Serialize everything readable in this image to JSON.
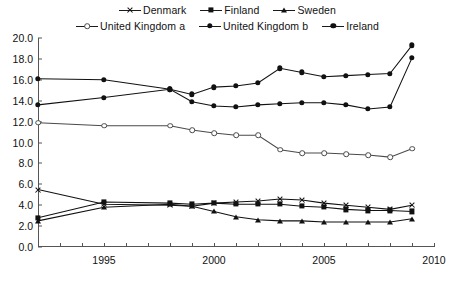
{
  "legend": {
    "rows": [
      [
        {
          "label": "Denmark",
          "marker": "cross"
        },
        {
          "label": "Finland",
          "marker": "square"
        },
        {
          "label": "Sweden",
          "marker": "triangle"
        }
      ],
      [
        {
          "label": "United Kingdom a",
          "marker": "opencircle"
        },
        {
          "label": "United Kingdom b",
          "marker": "circle"
        },
        {
          "label": "Ireland",
          "marker": "circle"
        }
      ]
    ]
  },
  "chart_data": {
    "type": "line",
    "title": "",
    "xlabel": "",
    "ylabel": "",
    "xlim": [
      1992,
      2010
    ],
    "ylim": [
      0.0,
      20.0
    ],
    "yticks": [
      "0.0",
      "2.0",
      "4.0",
      "6.0",
      "8.0",
      "10.0",
      "12.0",
      "14.0",
      "16.0",
      "18.0",
      "20.0"
    ],
    "ytick_values": [
      0,
      2,
      4,
      6,
      8,
      10,
      12,
      14,
      16,
      18,
      20
    ],
    "xticks": [
      "1995",
      "2000",
      "2005",
      "2010"
    ],
    "xtick_values": [
      1995,
      2000,
      2005,
      2010
    ],
    "xtick_minor": [
      1992,
      1993,
      1994,
      1996,
      1997,
      1998,
      1999,
      2001,
      2002,
      2003,
      2004,
      2006,
      2007,
      2008,
      2009
    ],
    "grid": false,
    "legend_position": "top",
    "x": [
      1992,
      1995,
      1998,
      1999,
      2000,
      2001,
      2002,
      2003,
      2004,
      2005,
      2006,
      2007,
      2008,
      2009
    ],
    "series": [
      {
        "name": "Denmark",
        "marker": "cross",
        "color": "#111111",
        "values": [
          5.5,
          4.1,
          4.0,
          3.9,
          4.2,
          4.3,
          4.4,
          4.6,
          4.5,
          4.2,
          4.0,
          3.8,
          3.6,
          4.0
        ]
      },
      {
        "name": "Finland",
        "marker": "square",
        "color": "#111111",
        "values": [
          2.8,
          4.3,
          4.2,
          4.1,
          4.2,
          4.1,
          4.1,
          4.1,
          3.9,
          3.8,
          3.6,
          3.5,
          3.5,
          3.4
        ]
      },
      {
        "name": "Sweden",
        "marker": "triangle",
        "color": "#111111",
        "values": [
          2.5,
          3.8,
          4.1,
          3.9,
          3.4,
          2.9,
          2.6,
          2.5,
          2.5,
          2.4,
          2.4,
          2.4,
          2.4,
          2.7
        ]
      },
      {
        "name": "United Kingdom a",
        "marker": "opencircle",
        "color": "#4a4a4a",
        "values": [
          11.9,
          11.6,
          11.6,
          11.2,
          10.9,
          10.7,
          10.7,
          9.3,
          9.0,
          9.0,
          8.9,
          8.8,
          8.6,
          9.4
        ]
      },
      {
        "name": "United Kingdom b",
        "marker": "circle",
        "color": "#111111",
        "values": [
          13.6,
          14.3,
          15.1,
          13.9,
          13.5,
          13.4,
          13.6,
          13.7,
          13.8,
          13.8,
          13.6,
          13.2,
          13.4,
          18.1
        ]
      },
      {
        "name": "Ireland",
        "marker": "circle",
        "color": "#111111",
        "values": [
          16.1,
          16.0,
          15.1,
          14.6,
          15.3,
          15.4,
          15.7,
          17.1,
          16.7,
          16.3,
          16.4,
          16.5,
          16.6,
          19.3
        ]
      }
    ]
  }
}
